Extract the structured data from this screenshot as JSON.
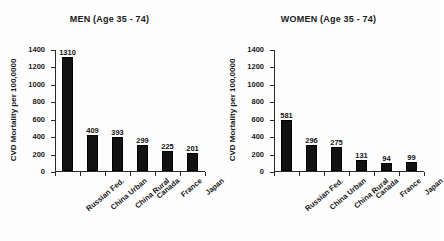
{
  "figure": {
    "background": "#ffffff",
    "bar_color": "#111111",
    "axis_color": "#2a2a2a"
  },
  "chart_data": [
    {
      "type": "bar",
      "title": "MEN (Age 35 - 74)",
      "xlabel": "",
      "ylabel": "CVD Mortality per 100,0000",
      "categories": [
        "Russian Fed.",
        "China Urban",
        "China Rural",
        "Canada",
        "France",
        "Japan"
      ],
      "values": [
        1310,
        409,
        393,
        299,
        225,
        201
      ],
      "value_labels": [
        "1310",
        "409",
        "393",
        "299",
        "225",
        "201"
      ],
      "ylim": [
        0,
        1400
      ],
      "yticks": [
        0,
        200,
        400,
        600,
        800,
        1000,
        1200,
        1400
      ],
      "ytick_labels": [
        "0",
        "200",
        "400",
        "600",
        "800",
        "1000",
        "1200",
        "1400"
      ],
      "grid": false,
      "legend": "none"
    },
    {
      "type": "bar",
      "title": "WOMEN (Age 35 - 74)",
      "xlabel": "",
      "ylabel": "CVD Mortality per 100,0000",
      "categories": [
        "Russian Fed.",
        "China Urban",
        "China Rural",
        "Canada",
        "France",
        "Japan"
      ],
      "values": [
        581,
        296,
        275,
        131,
        94,
        99
      ],
      "value_labels": [
        "581",
        "296",
        "275",
        "131",
        "94",
        "99"
      ],
      "ylim": [
        0,
        1400
      ],
      "yticks": [
        0,
        200,
        400,
        600,
        800,
        1000,
        1200,
        1400
      ],
      "ytick_labels": [
        "0",
        "200",
        "400",
        "600",
        "800",
        "1000",
        "1200",
        "1400"
      ],
      "grid": false,
      "legend": "none"
    }
  ]
}
